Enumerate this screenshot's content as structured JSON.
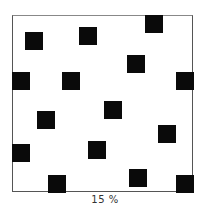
{
  "figure": {
    "caption": "15 %",
    "frame": {
      "x": 12,
      "y": 15,
      "width": 181,
      "height": 177
    },
    "square_size": 18,
    "square_color": "#0a0a0a",
    "squares": [
      {
        "x": 25,
        "y": 32
      },
      {
        "x": 79,
        "y": 27
      },
      {
        "x": 145,
        "y": 15
      },
      {
        "x": 127,
        "y": 55
      },
      {
        "x": 12,
        "y": 72
      },
      {
        "x": 62,
        "y": 72
      },
      {
        "x": 176,
        "y": 72
      },
      {
        "x": 104,
        "y": 101
      },
      {
        "x": 37,
        "y": 111
      },
      {
        "x": 158,
        "y": 125
      },
      {
        "x": 12,
        "y": 144
      },
      {
        "x": 88,
        "y": 141
      },
      {
        "x": 48,
        "y": 175
      },
      {
        "x": 129,
        "y": 169
      },
      {
        "x": 176,
        "y": 175
      }
    ]
  }
}
